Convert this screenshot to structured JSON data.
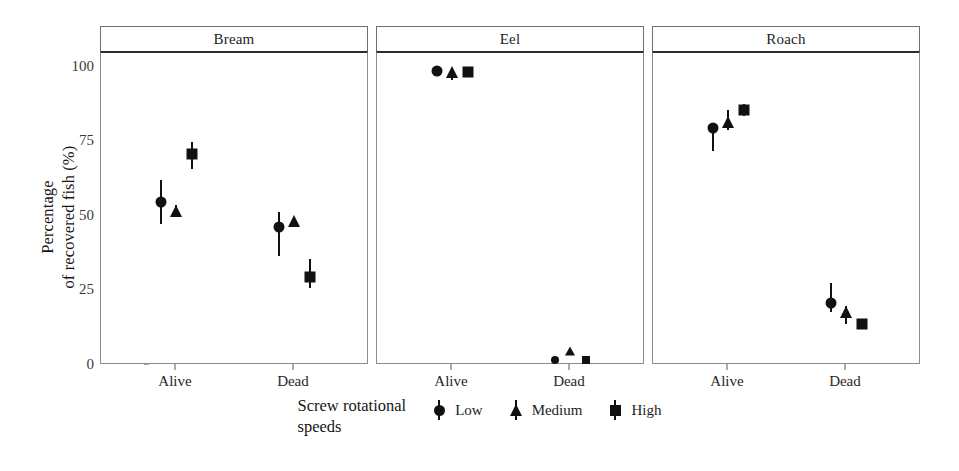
{
  "chart_data": {
    "type": "scatter",
    "title": "",
    "xlabel": "",
    "ylabel": "Percentage\nof recovered fish (%)",
    "ylim": [
      0,
      105
    ],
    "yticks": [
      0,
      25,
      50,
      75,
      100
    ],
    "ytick_labels": [
      "0",
      "25",
      "50",
      "75",
      "100"
    ],
    "categories": [
      "Alive",
      "Dead"
    ],
    "grid": false,
    "legend_position": "bottom",
    "legend_title": "Screw rotational\nspeeds",
    "panels": [
      "Bream",
      "Eel",
      "Roach"
    ],
    "series": [
      {
        "name": "Low",
        "marker": "circle"
      },
      {
        "name": "Medium",
        "marker": "triangle"
      },
      {
        "name": "High",
        "marker": "square"
      }
    ],
    "facets": [
      {
        "panel": "Bream",
        "points": [
          {
            "category": "Alive",
            "series": "Low",
            "value": 55.0,
            "ci_low": 47.5,
            "ci_high": 62.5
          },
          {
            "category": "Alive",
            "series": "Medium",
            "value": 52.0,
            "ci_low": 50.0,
            "ci_high": 54.0
          },
          {
            "category": "Alive",
            "series": "High",
            "value": 71.0,
            "ci_low": 66.0,
            "ci_high": 75.0
          },
          {
            "category": "Dead",
            "series": "Low",
            "value": 46.5,
            "ci_low": 37.0,
            "ci_high": 51.5
          },
          {
            "category": "Dead",
            "series": "Medium",
            "value": 48.5,
            "ci_low": 47.0,
            "ci_high": 50.0
          },
          {
            "category": "Dead",
            "series": "High",
            "value": 30.0,
            "ci_low": 26.0,
            "ci_high": 36.0
          }
        ]
      },
      {
        "panel": "Eel",
        "points": [
          {
            "category": "Alive",
            "series": "Low",
            "value": 99.0,
            "ci_low": 99.0,
            "ci_high": 99.0
          },
          {
            "category": "Alive",
            "series": "Medium",
            "value": 98.5,
            "ci_low": 96.0,
            "ci_high": 100.0
          },
          {
            "category": "Alive",
            "series": "High",
            "value": 98.5,
            "ci_low": 98.5,
            "ci_high": 98.5
          },
          {
            "category": "Dead",
            "series": "Low",
            "value": 2.0,
            "ci_low": 2.0,
            "ci_high": 2.0
          },
          {
            "category": "Dead",
            "series": "Medium",
            "value": 5.0,
            "ci_low": 5.0,
            "ci_high": 5.0
          },
          {
            "category": "Dead",
            "series": "High",
            "value": 2.0,
            "ci_low": 2.0,
            "ci_high": 2.0
          }
        ]
      },
      {
        "panel": "Roach",
        "points": [
          {
            "category": "Alive",
            "series": "Low",
            "value": 80.0,
            "ci_low": 72.0,
            "ci_high": 81.0
          },
          {
            "category": "Alive",
            "series": "Medium",
            "value": 82.0,
            "ci_low": 79.0,
            "ci_high": 86.0
          },
          {
            "category": "Alive",
            "series": "High",
            "value": 86.0,
            "ci_low": 84.0,
            "ci_high": 88.0
          },
          {
            "category": "Dead",
            "series": "Low",
            "value": 21.0,
            "ci_low": 18.0,
            "ci_high": 28.0
          },
          {
            "category": "Dead",
            "series": "Medium",
            "value": 18.0,
            "ci_low": 14.0,
            "ci_high": 20.0
          },
          {
            "category": "Dead",
            "series": "High",
            "value": 14.0,
            "ci_low": 13.0,
            "ci_high": 15.0
          }
        ]
      }
    ]
  },
  "axis": {
    "y_title": "Percentage\nof recovered fish (%)",
    "y_tick_labels": [
      "100",
      "75",
      "50",
      "25",
      "0"
    ],
    "x_tick_labels": [
      "Alive",
      "Dead"
    ]
  },
  "panels": [
    {
      "label": "Bream"
    },
    {
      "label": "Eel"
    },
    {
      "label": "Roach"
    }
  ],
  "legend": {
    "title": "Screw rotational\nspeeds",
    "items": [
      {
        "label": "Low",
        "marker": "circle"
      },
      {
        "label": "Medium",
        "marker": "triangle"
      },
      {
        "label": "High",
        "marker": "square"
      }
    ]
  },
  "colors": {
    "mark": "#111111",
    "panel_border": "#8c8c8c",
    "strip_border": "#6e6e6e",
    "text": "#1a1a1a"
  }
}
